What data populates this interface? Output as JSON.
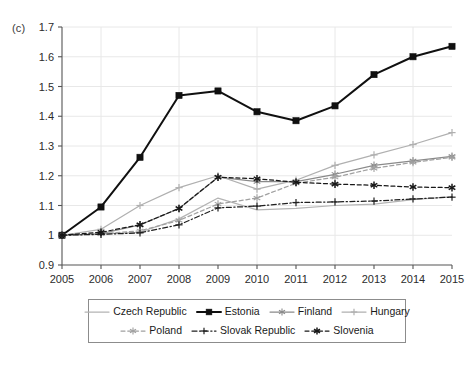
{
  "panel": {
    "label": "(c)"
  },
  "chart_data": {
    "type": "line",
    "title": "",
    "subtitle": "",
    "xlabel": "",
    "ylabel": "",
    "x": [
      2005,
      2006,
      2007,
      2008,
      2009,
      2010,
      2011,
      2012,
      2013,
      2014,
      2015
    ],
    "xtick_labels": [
      "2005",
      "2006",
      "2007",
      "2008",
      "2009",
      "2010",
      "2011",
      "2012",
      "2013",
      "2014",
      "2015"
    ],
    "ytick_labels": [
      "0.9",
      "1",
      "1.1",
      "1.2",
      "1.3",
      "1.4",
      "1.5",
      "1.6",
      "1.7"
    ],
    "ytick_values": [
      0.9,
      1.0,
      1.1,
      1.2,
      1.3,
      1.4,
      1.5,
      1.6,
      1.7
    ],
    "ylim": [
      0.9,
      1.7
    ],
    "xlim": [
      2005,
      2015
    ],
    "grid": "horizontal and vertical light gridlines, vertical every two years",
    "grid_x_values": [
      2006,
      2008,
      2010,
      2012,
      2014
    ],
    "legend_position": "below plot, boxed, two rows",
    "series": [
      {
        "name": "Czech Republic",
        "color": "#b4b4b4",
        "line_style": "solid",
        "marker": "none",
        "values": [
          1.0,
          1.005,
          1.01,
          1.055,
          1.125,
          1.085,
          1.09,
          1.1,
          1.105,
          1.12,
          1.13
        ]
      },
      {
        "name": "Estonia",
        "color": "#101010",
        "line_style": "solid",
        "marker": "square",
        "values": [
          1.0,
          1.095,
          1.262,
          1.47,
          1.485,
          1.415,
          1.385,
          1.435,
          1.54,
          1.6,
          1.635
        ]
      },
      {
        "name": "Finland",
        "color": "#8a8a8a",
        "line_style": "solid",
        "marker": "star",
        "values": [
          1.0,
          1.005,
          1.035,
          1.09,
          1.195,
          1.18,
          1.18,
          1.205,
          1.235,
          1.25,
          1.265
        ]
      },
      {
        "name": "Hungary",
        "color": "#b0b0b0",
        "line_style": "solid",
        "marker": "plus",
        "values": [
          1.0,
          1.02,
          1.1,
          1.16,
          1.2,
          1.155,
          1.185,
          1.235,
          1.27,
          1.305,
          1.345
        ]
      },
      {
        "name": "Poland",
        "color": "#a0a0a0",
        "line_style": "dashed",
        "marker": "star",
        "values": [
          1.0,
          1.005,
          1.015,
          1.05,
          1.105,
          1.125,
          1.175,
          1.195,
          1.225,
          1.245,
          1.262
        ]
      },
      {
        "name": "Slovak Republic",
        "color": "#202020",
        "line_style": "dashdot",
        "marker": "plus",
        "values": [
          1.0,
          1.003,
          1.008,
          1.035,
          1.092,
          1.098,
          1.11,
          1.112,
          1.115,
          1.122,
          1.128
        ]
      },
      {
        "name": "Slovenia",
        "color": "#181818",
        "line_style": "dashed",
        "marker": "asterisk",
        "values": [
          1.0,
          1.01,
          1.035,
          1.09,
          1.195,
          1.19,
          1.178,
          1.172,
          1.168,
          1.162,
          1.16
        ]
      }
    ]
  },
  "legend": {
    "rows": [
      [
        {
          "label": "Czech Republic"
        },
        {
          "label": "Estonia"
        },
        {
          "label": "Finland"
        },
        {
          "label": "Hungary"
        }
      ],
      [
        {
          "label": "Poland"
        },
        {
          "label": "Slovak Republic"
        },
        {
          "label": "Slovenia"
        }
      ]
    ]
  }
}
